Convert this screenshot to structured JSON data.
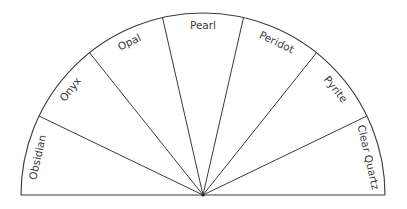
{
  "diagram": {
    "type": "semicircle-pendulum-chart",
    "center": [
      203,
      195
    ],
    "radius": 182,
    "line_color": "#3a3a3a",
    "text_color": "#3a3a3a",
    "segments": [
      {
        "label": "Obsidian"
      },
      {
        "label": "Onyx"
      },
      {
        "label": "Opal"
      },
      {
        "label": "Pearl"
      },
      {
        "label": "Peridot"
      },
      {
        "label": "Pyrite"
      },
      {
        "label": "Clear Quartz"
      }
    ]
  }
}
